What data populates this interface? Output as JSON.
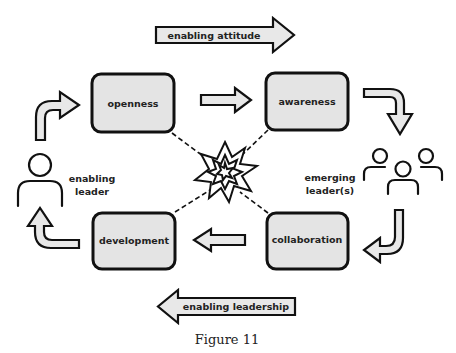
{
  "diagram": {
    "boxes": {
      "openness": "openness",
      "awareness": "awareness",
      "collaboration": "collaboration",
      "development": "development"
    },
    "banners": {
      "top": "enabling attitude",
      "bottom": "enabling leadership"
    },
    "actors": {
      "left_line1": "enabling",
      "left_line2": "leader",
      "right_line1": "emerging",
      "right_line2": "leader(s)"
    },
    "center_icon": "explosion-starburst-icon",
    "caption": "Figure 11",
    "colors": {
      "box_fill": "#e4e4e4",
      "stroke": "#111111",
      "arrow_fill": "#e8e8e8"
    }
  }
}
